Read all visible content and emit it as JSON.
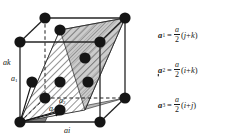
{
  "figure": {
    "type": "fcc-lattice-primitive-vectors",
    "caption_present": false
  },
  "diagram": {
    "name": "face-centered-cubic-unit-cell",
    "axis_labels": {
      "vertical": "ak",
      "horizontal": "ai"
    },
    "vector_labels": {
      "a1": "a",
      "a1_sub": "1",
      "a2": "a",
      "a2_sub": "2",
      "a3": "a",
      "a3_sub": "3"
    },
    "atom_count": 14,
    "colors": {
      "atom": "#1a1a1a",
      "edge": "#2b2b2b",
      "plane_dark": "#7d7d7d",
      "plane_light": "#b9b9b9",
      "hatch": "#2b2b2b",
      "background": "#ffffff"
    }
  },
  "equations": {
    "brace_glyph": "{",
    "items": [
      {
        "lhs": "a",
        "lhs_sub": "1",
        "eq": "=",
        "num": "a",
        "den": "2",
        "rhs": "(ĵ+k̂)",
        "open": "(",
        "u1": "j",
        "plus": "+",
        "u2": "k",
        "close": ")"
      },
      {
        "lhs": "a",
        "lhs_sub": "2",
        "eq": "=",
        "num": "a",
        "den": "2",
        "rhs": "(î+k̂)",
        "open": "(",
        "u1": "i",
        "plus": "+",
        "u2": "k",
        "close": ")"
      },
      {
        "lhs": "a",
        "lhs_sub": "3",
        "eq": "=",
        "num": "a",
        "den": "2",
        "rhs": "(î+ĵ)",
        "open": "(",
        "u1": "i",
        "plus": "+",
        "u2": "j",
        "close": ")"
      }
    ]
  }
}
